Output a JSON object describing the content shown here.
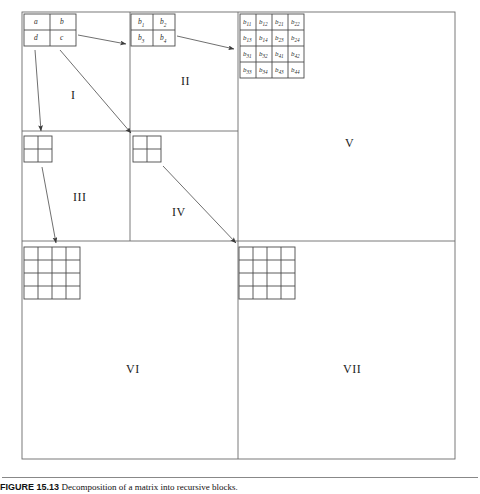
{
  "figure": {
    "outer_frame": {
      "x": 22,
      "y": 12,
      "w": 433,
      "h": 447
    },
    "stroke_color": "#6b6b6b",
    "text_color": "#222222"
  },
  "matrices": {
    "level1": {
      "name": "2x2-matrix-abdc",
      "x": 24,
      "y": 14,
      "w": 52,
      "h": 32,
      "rows": [
        [
          "a",
          "b"
        ],
        [
          "d",
          "c"
        ]
      ]
    },
    "level2": {
      "name": "2x2-matrix-b1-b4",
      "x": 131,
      "y": 14,
      "w": 44,
      "h": 32,
      "rows": [
        [
          {
            "base": "b",
            "sub": "1"
          },
          {
            "base": "b",
            "sub": "2"
          }
        ],
        [
          {
            "base": "b",
            "sub": "3"
          },
          {
            "base": "b",
            "sub": "4"
          }
        ]
      ]
    },
    "level3": {
      "name": "4x4-matrix-bij",
      "x": 240,
      "y": 14,
      "w": 64,
      "h": 64,
      "rows": [
        [
          {
            "base": "b",
            "sub": "11"
          },
          {
            "base": "b",
            "sub": "12"
          },
          {
            "base": "b",
            "sub": "21"
          },
          {
            "base": "b",
            "sub": "22"
          }
        ],
        [
          {
            "base": "b",
            "sub": "13"
          },
          {
            "base": "b",
            "sub": "14"
          },
          {
            "base": "b",
            "sub": "23"
          },
          {
            "base": "b",
            "sub": "24"
          }
        ],
        [
          {
            "base": "b",
            "sub": "31"
          },
          {
            "base": "b",
            "sub": "32"
          },
          {
            "base": "b",
            "sub": "41"
          },
          {
            "base": "b",
            "sub": "42"
          }
        ],
        [
          {
            "base": "b",
            "sub": "33"
          },
          {
            "base": "b",
            "sub": "34"
          },
          {
            "base": "b",
            "sub": "43"
          },
          {
            "base": "b",
            "sub": "44"
          }
        ]
      ]
    },
    "grid_iii": {
      "name": "empty-2x2-grid-iii",
      "x": 24,
      "y": 136,
      "w": 28,
      "h": 26,
      "rows": 2,
      "cols": 2
    },
    "grid_iv": {
      "name": "empty-2x2-grid-iv",
      "x": 133,
      "y": 136,
      "w": 28,
      "h": 26,
      "rows": 2,
      "cols": 2
    },
    "grid_vi": {
      "name": "empty-4x4-grid-vi",
      "x": 24,
      "y": 247,
      "w": 56,
      "h": 52,
      "rows": 4,
      "cols": 4
    },
    "grid_vii": {
      "name": "empty-4x4-grid-vii",
      "x": 239,
      "y": 247,
      "w": 56,
      "h": 52,
      "rows": 4,
      "cols": 4
    }
  },
  "regions": [
    {
      "id": "I",
      "label": "I",
      "x": 71,
      "y": 88
    },
    {
      "id": "II",
      "label": "II",
      "x": 181,
      "y": 74
    },
    {
      "id": "III",
      "label": "III",
      "x": 73,
      "y": 190
    },
    {
      "id": "IV",
      "label": "IV",
      "x": 172,
      "y": 205
    },
    {
      "id": "V",
      "label": "V",
      "x": 345,
      "y": 136
    },
    {
      "id": "VI",
      "label": "VI",
      "x": 126,
      "y": 362
    },
    {
      "id": "VII",
      "label": "VII",
      "x": 343,
      "y": 362
    }
  ],
  "arrows": [
    {
      "name": "arrow-abdc-to-b1b4",
      "x1": 78,
      "y1": 36,
      "x2": 128,
      "y2": 44
    },
    {
      "name": "arrow-b1b4-to-bij",
      "x1": 177,
      "y1": 36,
      "x2": 236,
      "y2": 48
    },
    {
      "name": "arrow-abdc-down-i",
      "x1": 36,
      "y1": 50,
      "x2": 42,
      "y2": 130
    },
    {
      "name": "arrow-abdc-diag-iv",
      "x1": 60,
      "y1": 50,
      "x2": 130,
      "y2": 132
    },
    {
      "name": "arrow-iii-down-vi",
      "x1": 42,
      "y1": 166,
      "x2": 56,
      "y2": 242
    },
    {
      "name": "arrow-iv-diag-vii",
      "x1": 163,
      "y1": 166,
      "x2": 236,
      "y2": 242
    }
  ],
  "dividers": {
    "outer_h_mid": {
      "name": "divider-horizontal-mid",
      "x1": 22,
      "y1": 241,
      "x2": 455,
      "y2": 241
    },
    "outer_v_mid": {
      "name": "divider-vertical-mid",
      "x1": 238,
      "y1": 241,
      "x2": 238,
      "y2": 459
    },
    "q1_h_mid": {
      "name": "divider-q1-horizontal",
      "x1": 22,
      "y1": 131,
      "x2": 238,
      "y2": 131
    },
    "q1_v_mid": {
      "name": "divider-q1-vertical",
      "x1": 130,
      "y1": 12,
      "x2": 130,
      "y2": 241
    },
    "right_v": {
      "name": "divider-right-vertical",
      "x1": 238,
      "y1": 12,
      "x2": 238,
      "y2": 241
    }
  },
  "caption": {
    "figure_number": "FIGURE 15.13",
    "body": "Decomposition of a matrix into recursive blocks."
  }
}
